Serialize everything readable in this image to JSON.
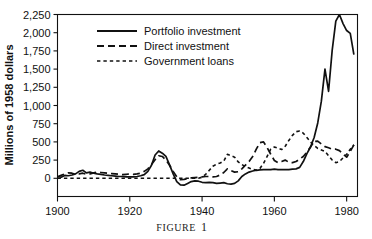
{
  "figure": {
    "caption_text": "FIGURE",
    "caption_number": "1"
  },
  "chart_data": {
    "type": "line",
    "title": "",
    "xlabel": "",
    "ylabel": "Millions of 1958 dollars",
    "xlim": [
      1900,
      1983
    ],
    "ylim": [
      -250,
      2250
    ],
    "grid": false,
    "legend_position": "top-left",
    "x_ticks": [
      1900,
      1920,
      1940,
      1960,
      1980
    ],
    "x_tick_labels": [
      "1900",
      "1920",
      "1940",
      "1960",
      "1980"
    ],
    "y_ticks": [
      0,
      250,
      500,
      750,
      1000,
      1250,
      1500,
      1750,
      2000,
      2250
    ],
    "y_tick_labels": [
      "0",
      "250",
      "500",
      "750",
      "1,000",
      "1,250",
      "1,500",
      "1,750",
      "2,000",
      "2,250"
    ],
    "series": [
      {
        "name": "Portfolio investment",
        "style": "solid",
        "color": "#111111",
        "x": [
          1900,
          1901,
          1902,
          1903,
          1904,
          1905,
          1906,
          1907,
          1908,
          1909,
          1910,
          1911,
          1912,
          1913,
          1914,
          1915,
          1916,
          1917,
          1918,
          1919,
          1920,
          1921,
          1922,
          1923,
          1924,
          1925,
          1926,
          1927,
          1928,
          1929,
          1930,
          1931,
          1932,
          1933,
          1934,
          1935,
          1936,
          1937,
          1938,
          1939,
          1940,
          1941,
          1942,
          1943,
          1944,
          1945,
          1946,
          1947,
          1948,
          1949,
          1950,
          1951,
          1952,
          1953,
          1954,
          1955,
          1956,
          1957,
          1958,
          1959,
          1960,
          1961,
          1962,
          1963,
          1964,
          1965,
          1966,
          1967,
          1968,
          1969,
          1970,
          1971,
          1972,
          1973,
          1974,
          1975,
          1976,
          1977,
          1978,
          1979,
          1980,
          1981,
          1982
        ],
        "values": [
          25,
          15,
          40,
          35,
          45,
          60,
          95,
          110,
          75,
          85,
          70,
          60,
          55,
          45,
          40,
          35,
          30,
          25,
          25,
          20,
          20,
          20,
          25,
          35,
          50,
          95,
          180,
          320,
          375,
          345,
          300,
          185,
          60,
          -45,
          -90,
          -95,
          -70,
          -45,
          -35,
          -40,
          -55,
          -60,
          -55,
          -60,
          -70,
          -65,
          -60,
          -75,
          -80,
          -70,
          -35,
          25,
          60,
          85,
          100,
          110,
          115,
          120,
          120,
          120,
          125,
          120,
          120,
          120,
          120,
          125,
          130,
          150,
          230,
          340,
          430,
          560,
          760,
          1060,
          1500,
          1195,
          1760,
          2160,
          2250,
          2125,
          2030,
          1990,
          1700
        ],
        "units": "Millions of 1958 dollars"
      },
      {
        "name": "Direct investment",
        "style": "long-dash",
        "color": "#111111",
        "x": [
          1900,
          1901,
          1902,
          1903,
          1904,
          1905,
          1906,
          1907,
          1908,
          1909,
          1910,
          1911,
          1912,
          1913,
          1914,
          1915,
          1916,
          1917,
          1918,
          1919,
          1920,
          1921,
          1922,
          1923,
          1924,
          1925,
          1926,
          1927,
          1928,
          1929,
          1930,
          1931,
          1932,
          1933,
          1934,
          1935,
          1936,
          1937,
          1938,
          1939,
          1940,
          1941,
          1942,
          1943,
          1944,
          1945,
          1946,
          1947,
          1948,
          1949,
          1950,
          1951,
          1952,
          1953,
          1954,
          1955,
          1956,
          1957,
          1958,
          1959,
          1960,
          1961,
          1962,
          1963,
          1964,
          1965,
          1966,
          1967,
          1968,
          1969,
          1970,
          1971,
          1972,
          1973,
          1974,
          1975,
          1976,
          1977,
          1978,
          1979,
          1980,
          1981,
          1982
        ],
        "values": [
          20,
          40,
          60,
          75,
          70,
          55,
          60,
          70,
          55,
          60,
          75,
          85,
          80,
          75,
          70,
          65,
          60,
          55,
          50,
          55,
          60,
          55,
          60,
          70,
          95,
          130,
          190,
          255,
          310,
          300,
          250,
          180,
          95,
          20,
          -20,
          -15,
          -5,
          5,
          10,
          15,
          20,
          25,
          25,
          20,
          25,
          45,
          80,
          130,
          105,
          85,
          90,
          130,
          180,
          230,
          300,
          400,
          490,
          500,
          420,
          330,
          245,
          215,
          230,
          250,
          220,
          215,
          230,
          265,
          300,
          360,
          430,
          505,
          510,
          470,
          435,
          420,
          400,
          400,
          380,
          335,
          290,
          370,
          460
        ],
        "units": "Millions of 1958 dollars"
      },
      {
        "name": "Government loans",
        "style": "short-dash",
        "color": "#111111",
        "x": [
          1900,
          1901,
          1902,
          1903,
          1904,
          1905,
          1906,
          1907,
          1908,
          1909,
          1910,
          1911,
          1912,
          1913,
          1914,
          1915,
          1916,
          1917,
          1918,
          1919,
          1920,
          1921,
          1922,
          1923,
          1924,
          1925,
          1926,
          1927,
          1928,
          1929,
          1930,
          1931,
          1932,
          1933,
          1934,
          1935,
          1936,
          1937,
          1938,
          1939,
          1940,
          1941,
          1942,
          1943,
          1944,
          1945,
          1946,
          1947,
          1948,
          1949,
          1950,
          1951,
          1952,
          1953,
          1954,
          1955,
          1956,
          1957,
          1958,
          1959,
          1960,
          1961,
          1962,
          1963,
          1964,
          1965,
          1966,
          1967,
          1968,
          1969,
          1970,
          1971,
          1972,
          1973,
          1974,
          1975,
          1976,
          1977,
          1978,
          1979,
          1980,
          1981,
          1982
        ],
        "values": [
          0,
          0,
          0,
          0,
          0,
          0,
          0,
          0,
          0,
          0,
          0,
          0,
          0,
          0,
          0,
          0,
          0,
          0,
          0,
          0,
          0,
          0,
          0,
          0,
          0,
          0,
          0,
          0,
          0,
          0,
          0,
          0,
          0,
          0,
          0,
          0,
          0,
          0,
          0,
          0,
          15,
          55,
          110,
          165,
          195,
          210,
          235,
          330,
          310,
          290,
          225,
          190,
          160,
          140,
          120,
          115,
          135,
          205,
          300,
          400,
          430,
          415,
          395,
          440,
          520,
          590,
          640,
          650,
          620,
          560,
          500,
          450,
          410,
          390,
          370,
          310,
          250,
          215,
          230,
          280,
          330,
          400,
          460
        ],
        "units": "Millions of 1958 dollars"
      }
    ]
  }
}
